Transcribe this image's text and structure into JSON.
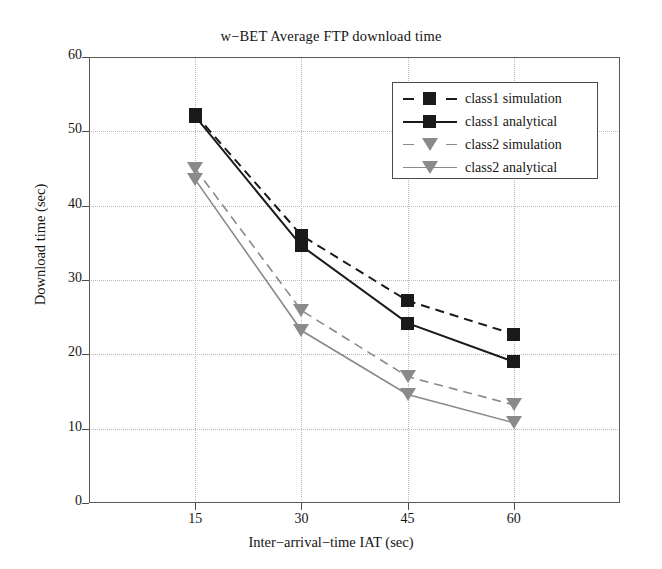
{
  "chart_data": {
    "type": "line",
    "title": "w−BET Average FTP download time",
    "xlabel": "Inter−arrival−time IAT (sec)",
    "ylabel": "Download time (sec)",
    "x": [
      15,
      30,
      45,
      60
    ],
    "xticks": [
      "15",
      "30",
      "45",
      "60"
    ],
    "yticks": [
      "0",
      "10",
      "20",
      "30",
      "40",
      "50",
      "60"
    ],
    "xlim": [
      0,
      75
    ],
    "ylim": [
      0,
      60
    ],
    "grid": true,
    "legend_position": "upper right",
    "series": [
      {
        "name": "class1 simulation",
        "values": [
          52.3,
          36.0,
          27.2,
          22.7
        ],
        "color": "#1a1a1a",
        "linestyle": "dashed",
        "marker": "square"
      },
      {
        "name": "class1 analytical",
        "values": [
          52.0,
          34.6,
          24.2,
          19.0
        ],
        "color": "#1a1a1a",
        "linestyle": "solid",
        "marker": "square"
      },
      {
        "name": "class2 simulation",
        "values": [
          45.0,
          25.9,
          17.0,
          13.2
        ],
        "color": "#8a8a8a",
        "linestyle": "dashed",
        "marker": "triangle-down"
      },
      {
        "name": "class2 analytical",
        "values": [
          43.5,
          23.2,
          14.6,
          10.8
        ],
        "color": "#8a8a8a",
        "linestyle": "solid",
        "marker": "triangle-down"
      }
    ]
  },
  "legend": {
    "entries": [
      {
        "label": "class1 simulation"
      },
      {
        "label": "class1 analytical"
      },
      {
        "label": "class2 simulation"
      },
      {
        "label": "class2 analytical"
      }
    ]
  },
  "colors": {
    "class1": "#1a1a1a",
    "class2": "#8a8a8a",
    "grid": "#b9b9b9",
    "axis": "#4a4a4a",
    "background": "#ffffff"
  }
}
